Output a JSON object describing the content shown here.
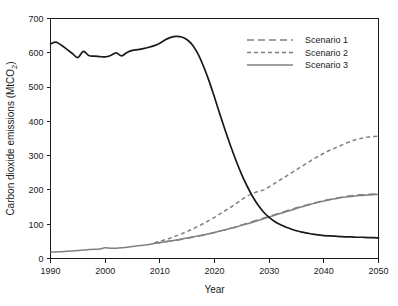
{
  "chart_data": {
    "type": "line",
    "title": "",
    "xlabel": "Year",
    "ylabel": "Carbon dioxide emissions (MtCO2)",
    "ylabel_display": "Carbon dioxide emissions (MtCO",
    "ylabel_sub": "2",
    "ylabel_tail": ")",
    "xlim": [
      1990,
      2050
    ],
    "ylim": [
      0,
      700
    ],
    "xticks": [
      1990,
      2000,
      2010,
      2020,
      2030,
      2040,
      2050
    ],
    "yticks": [
      0,
      100,
      200,
      300,
      400,
      500,
      600,
      700
    ],
    "xtick_labels": [
      "1990",
      "2000",
      "2010",
      "2020",
      "2030",
      "2040",
      "2050"
    ],
    "ytick_labels": [
      "0",
      "100",
      "200",
      "300",
      "400",
      "500",
      "600",
      "700"
    ],
    "grid": false,
    "legend_position": "top-right",
    "legend_entries": [
      "Scenario 1",
      "Scenario 2",
      "Scenario 3"
    ],
    "series": [
      {
        "name": "Historical and projected emissions",
        "style": "solid",
        "color": "#1a1a1a",
        "in_legend": false,
        "x": [
          1990,
          1991,
          1992,
          1993,
          1994,
          1995,
          1996,
          1997,
          1998,
          1999,
          2000,
          2001,
          2002,
          2003,
          2004,
          2005,
          2006,
          2007,
          2008,
          2009,
          2010,
          2011,
          2012,
          2013,
          2014,
          2015,
          2016,
          2017,
          2018,
          2019,
          2020,
          2021,
          2022,
          2023,
          2024,
          2025,
          2026,
          2027,
          2028,
          2029,
          2030,
          2031,
          2032,
          2033,
          2034,
          2035,
          2036,
          2037,
          2038,
          2039,
          2040,
          2041,
          2042,
          2043,
          2044,
          2045,
          2046,
          2047,
          2048,
          2049,
          2050
        ],
        "y": [
          626,
          631,
          622,
          610,
          598,
          586,
          604,
          592,
          590,
          589,
          588,
          592,
          600,
          591,
          601,
          607,
          609,
          612,
          616,
          621,
          628,
          638,
          645,
          648,
          646,
          638,
          622,
          596,
          560,
          518,
          470,
          420,
          372,
          326,
          283,
          244,
          210,
          180,
          155,
          135,
          120,
          108,
          99,
          92,
          86,
          81,
          77,
          74,
          71,
          69,
          67,
          66,
          65,
          64,
          63,
          63,
          62,
          62,
          61,
          61,
          60
        ]
      },
      {
        "name": "Scenario 1",
        "style": "long-dash",
        "color": "#808080",
        "in_legend": true,
        "x": [
          2009,
          2010,
          2011,
          2012,
          2013,
          2014,
          2015,
          2016,
          2017,
          2018,
          2019,
          2020,
          2021,
          2022,
          2023,
          2024,
          2025,
          2026,
          2027,
          2028,
          2029,
          2030,
          2031,
          2032,
          2033,
          2034,
          2035,
          2036,
          2037,
          2038,
          2039,
          2040,
          2041,
          2042,
          2043,
          2044,
          2045,
          2046,
          2047,
          2048,
          2049,
          2050
        ],
        "y": [
          45,
          47,
          49,
          51,
          53,
          56,
          59,
          62,
          65,
          68,
          72,
          76,
          80,
          84,
          88,
          93,
          98,
          103,
          108,
          113,
          118,
          123,
          128,
          133,
          138,
          143,
          148,
          152,
          157,
          161,
          165,
          169,
          172,
          175,
          178,
          181,
          183,
          185,
          186,
          187,
          188,
          189
        ]
      },
      {
        "name": "Scenario 2",
        "style": "short-dash",
        "color": "#808080",
        "in_legend": true,
        "x": [
          2009,
          2010,
          2011,
          2012,
          2013,
          2014,
          2015,
          2016,
          2017,
          2018,
          2019,
          2020,
          2021,
          2022,
          2023,
          2024,
          2025,
          2026,
          2027,
          2028,
          2029,
          2030,
          2031,
          2032,
          2033,
          2034,
          2035,
          2036,
          2037,
          2038,
          2039,
          2040,
          2041,
          2042,
          2043,
          2044,
          2045,
          2046,
          2047,
          2048,
          2049,
          2050
        ],
        "y": [
          46,
          50,
          55,
          60,
          66,
          72,
          79,
          86,
          94,
          102,
          111,
          120,
          130,
          140,
          150,
          161,
          172,
          182,
          190,
          196,
          200,
          209,
          219,
          229,
          239,
          249,
          259,
          269,
          279,
          289,
          298,
          307,
          315,
          322,
          329,
          336,
          342,
          347,
          351,
          354,
          356,
          357
        ]
      },
      {
        "name": "Scenario 3",
        "style": "solid",
        "color": "#808080",
        "in_legend": true,
        "x": [
          1990,
          1991,
          1992,
          1993,
          1994,
          1995,
          1996,
          1997,
          1998,
          1999,
          2000,
          2001,
          2002,
          2003,
          2004,
          2005,
          2006,
          2007,
          2008,
          2009,
          2010,
          2011,
          2012,
          2013,
          2014,
          2015,
          2016,
          2017,
          2018,
          2019,
          2020,
          2021,
          2022,
          2023,
          2024,
          2025,
          2026,
          2027,
          2028,
          2029,
          2030,
          2031,
          2032,
          2033,
          2034,
          2035,
          2036,
          2037,
          2038,
          2039,
          2040,
          2041,
          2042,
          2043,
          2044,
          2045,
          2046,
          2047,
          2048,
          2049,
          2050
        ],
        "y": [
          18,
          19,
          20,
          21,
          22,
          23,
          25,
          26,
          27,
          28,
          31,
          30,
          30,
          31,
          33,
          35,
          37,
          39,
          41,
          44,
          46,
          49,
          51,
          54,
          57,
          60,
          63,
          66,
          69,
          72,
          76,
          80,
          84,
          88,
          92,
          97,
          101,
          106,
          111,
          116,
          121,
          126,
          131,
          136,
          141,
          146,
          151,
          155,
          160,
          164,
          168,
          171,
          174,
          177,
          179,
          181,
          183,
          184,
          185,
          186,
          187
        ]
      }
    ]
  },
  "colors": {
    "historical": "#1a1a1a",
    "scenario": "#808080",
    "axis": "#1a1a1a",
    "background": "#ffffff"
  }
}
